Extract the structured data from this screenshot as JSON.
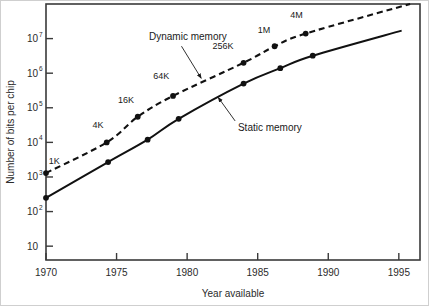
{
  "chart_data": {
    "type": "line",
    "title": "",
    "xlabel": "Year available",
    "ylabel": "Number of bits per chip",
    "xlim": [
      1970,
      1996.5
    ],
    "ylim_log10": [
      0.6,
      8.0
    ],
    "x_ticks": [
      1970,
      1975,
      1980,
      1985,
      1990,
      1995
    ],
    "x_tick_labels": [
      "1970",
      "1975",
      "1980",
      "1985",
      "1990",
      "1995"
    ],
    "y_ticks_log10": [
      1,
      2,
      3,
      4,
      5,
      6,
      7
    ],
    "y_tick_labels": [
      {
        "base": "10",
        "exp": ""
      },
      {
        "base": "10",
        "exp": "2"
      },
      {
        "base": "10",
        "exp": "3"
      },
      {
        "base": "10",
        "exp": "4"
      },
      {
        "base": "10",
        "exp": "5"
      },
      {
        "base": "10",
        "exp": "6"
      },
      {
        "base": "10",
        "exp": "7"
      }
    ],
    "grid": false,
    "legend_position": "inline-annotations",
    "series": [
      {
        "name": "Dynamic memory",
        "style": "dashed",
        "color": "#111111",
        "label_text": "Dynamic memory",
        "label_x": 1977.3,
        "label_y_log10": 6.95,
        "arrow_from": [
          1979.6,
          6.78
        ],
        "arrow_to": [
          1981.0,
          5.85
        ],
        "x": [
          1970.0,
          1974.3,
          1976.5,
          1979.0,
          1984.0,
          1986.2,
          1988.4,
          1995.8
        ],
        "y": [
          1300,
          10000,
          55000,
          220000,
          2000000,
          6000000,
          14000000,
          100000000
        ],
        "markers": [
          true,
          true,
          true,
          true,
          true,
          true,
          true,
          false
        ],
        "point_labels": [
          {
            "text": "1K",
            "x": 1970.2,
            "y_log10": 3.38,
            "anchor": "start"
          },
          {
            "text": "4K",
            "x": 1973.3,
            "y_log10": 4.42,
            "anchor": "start"
          },
          {
            "text": "16K",
            "x": 1975.1,
            "y_log10": 5.14,
            "anchor": "start"
          },
          {
            "text": "64K",
            "x": 1977.6,
            "y_log10": 5.83,
            "anchor": "start"
          },
          {
            "text": "256K",
            "x": 1981.8,
            "y_log10": 6.7,
            "anchor": "start"
          },
          {
            "text": "1M",
            "x": 1985.0,
            "y_log10": 7.17,
            "anchor": "start"
          },
          {
            "text": "4M",
            "x": 1987.3,
            "y_log10": 7.6,
            "anchor": "start"
          }
        ]
      },
      {
        "name": "Static memory",
        "style": "solid",
        "color": "#111111",
        "label_text": "Static memory",
        "label_x": 1983.6,
        "label_y_log10": 4.32,
        "arrow_from": [
          1983.4,
          4.62
        ],
        "arrow_to": [
          1982.2,
          5.3
        ],
        "x": [
          1970.0,
          1974.4,
          1977.2,
          1979.4,
          1984.0,
          1986.6,
          1988.9,
          1995.2
        ],
        "y": [
          250,
          2700,
          12000,
          48000,
          500000,
          1400000,
          3200000,
          17000000
        ],
        "markers": [
          true,
          true,
          true,
          true,
          true,
          true,
          true,
          false
        ],
        "point_labels": []
      }
    ]
  },
  "figure": {
    "frame_color": "#3a3a3a",
    "background": "#ffffff",
    "outer_border": true
  }
}
